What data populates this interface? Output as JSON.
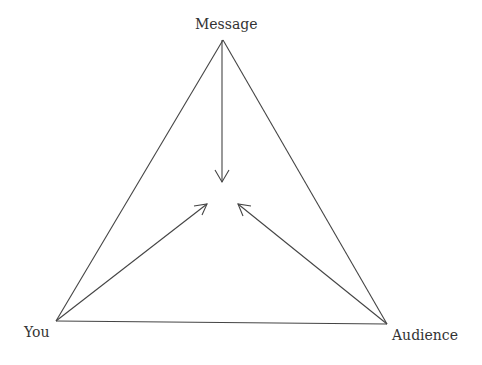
{
  "diagram": {
    "nodes": {
      "message": {
        "label": "Message",
        "x": 223,
        "y": 40
      },
      "you": {
        "label": "You",
        "x": 56,
        "y": 321
      },
      "audience": {
        "label": "Audience",
        "x": 387,
        "y": 324
      }
    },
    "edges": [
      {
        "from": "message",
        "to": "you"
      },
      {
        "from": "message",
        "to": "audience"
      },
      {
        "from": "you",
        "to": "audience"
      }
    ],
    "arrows": [
      {
        "from": "message",
        "to": "center",
        "tip": [
          222,
          182
        ]
      },
      {
        "from": "you",
        "to": "center",
        "tip": [
          207,
          204
        ]
      },
      {
        "from": "audience",
        "to": "center",
        "tip": [
          238,
          204
        ]
      }
    ],
    "colors": {
      "line": "#444444",
      "text": "#333333",
      "background": "#ffffff"
    }
  }
}
